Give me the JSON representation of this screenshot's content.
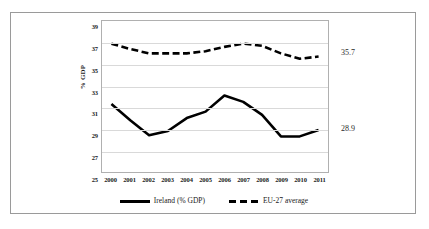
{
  "chart_data": {
    "type": "line",
    "title": "",
    "xlabel": "",
    "ylabel": "% GDP",
    "ylim": [
      25,
      39
    ],
    "yticks": [
      39,
      37,
      35,
      33,
      31,
      29,
      27,
      25
    ],
    "grid": true,
    "legend_position": "bottom",
    "categories": [
      "2000",
      "2001",
      "2002",
      "2003",
      "2004",
      "2005",
      "2006",
      "2007",
      "2008",
      "2009",
      "2010",
      "2011"
    ],
    "series": [
      {
        "name": "Ireland (% GDP)",
        "style": "solid",
        "color": "#000000",
        "values": [
          31.3,
          29.8,
          28.4,
          28.8,
          30.0,
          30.6,
          32.1,
          31.5,
          30.3,
          28.3,
          28.3,
          28.9
        ]
      },
      {
        "name": "EU-27 average",
        "style": "dashed",
        "color": "#000000",
        "values": [
          36.9,
          36.4,
          36.0,
          36.0,
          36.0,
          36.2,
          36.6,
          36.9,
          36.7,
          36.0,
          35.5,
          35.7
        ]
      }
    ],
    "annotations": [
      {
        "text": "35.7",
        "series": "EU-27 average",
        "category": "2011"
      },
      {
        "text": "28.9",
        "series": "Ireland (% GDP)",
        "category": "2011"
      }
    ]
  },
  "legend": {
    "items": [
      {
        "label": "Ireland (% GDP)",
        "style": "solid"
      },
      {
        "label": "EU-27 average",
        "style": "dashed"
      }
    ]
  },
  "colors": {
    "line": "#000000",
    "gridline": "#d9d9d9",
    "plot_border": "#b0b0b0",
    "figure_border": "#9a9a9a",
    "text": "#1a1a1a",
    "background": "#ffffff"
  }
}
